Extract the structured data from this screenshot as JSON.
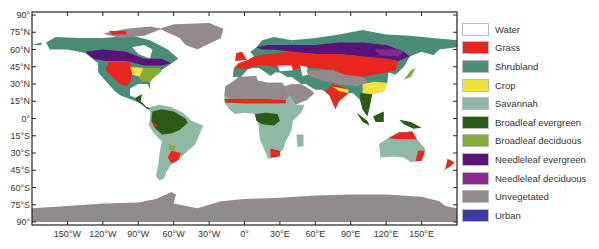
{
  "figure": {
    "type": "land cover map",
    "projection": "equirectangular",
    "frame": {
      "x0": 32,
      "y0": 12,
      "x1": 457,
      "y1": 225
    }
  },
  "axes": {
    "y_ticks": [
      {
        "lat": 90,
        "label": "90°"
      },
      {
        "lat": 75,
        "label": "75°N"
      },
      {
        "lat": 60,
        "label": "60°N"
      },
      {
        "lat": 45,
        "label": "45°N"
      },
      {
        "lat": 30,
        "label": "30°N"
      },
      {
        "lat": 15,
        "label": "15°N"
      },
      {
        "lat": 0,
        "label": "0°"
      },
      {
        "lat": -15,
        "label": "15°S"
      },
      {
        "lat": -30,
        "label": "30°S"
      },
      {
        "lat": -45,
        "label": "45°S"
      },
      {
        "lat": -60,
        "label": "60°S"
      },
      {
        "lat": -75,
        "label": "75°S"
      },
      {
        "lat": -90,
        "label": "90°"
      }
    ],
    "x_ticks": [
      {
        "lon": -150,
        "label": "150°W"
      },
      {
        "lon": -120,
        "label": "120°W"
      },
      {
        "lon": -90,
        "label": "90°W"
      },
      {
        "lon": -60,
        "label": "60°W"
      },
      {
        "lon": -30,
        "label": "30°W"
      },
      {
        "lon": 0,
        "label": "0°"
      },
      {
        "lon": 30,
        "label": "30°E"
      },
      {
        "lon": 60,
        "label": "60°E"
      },
      {
        "lon": 90,
        "label": "90°E"
      },
      {
        "lon": 120,
        "label": "120°E"
      },
      {
        "lon": 150,
        "label": "150°E"
      }
    ]
  },
  "legend": {
    "items": [
      {
        "key": "water",
        "label": "Water",
        "color": "#ffffff"
      },
      {
        "key": "grass",
        "label": "Grass",
        "color": "#e8281e"
      },
      {
        "key": "shrubland",
        "label": "Shrubland",
        "color": "#4a8c78"
      },
      {
        "key": "crop",
        "label": "Crop",
        "color": "#f2e23c"
      },
      {
        "key": "savannah",
        "label": "Savannah",
        "color": "#8fb8a6"
      },
      {
        "key": "broadleaf_evergreen",
        "label": "Broadleaf evergreen",
        "color": "#2e5a18"
      },
      {
        "key": "broadleaf_deciduous",
        "label": "Broadleaf deciduous",
        "color": "#86ac3a"
      },
      {
        "key": "needleleaf_evergreen",
        "label": "Needleleaf evergreen",
        "color": "#5a1478"
      },
      {
        "key": "needleleaf_deciduous",
        "label": "Needleleaf deciduous",
        "color": "#8a2a8e"
      },
      {
        "key": "unvegetated",
        "label": "Unvegetated",
        "color": "#938a8e"
      },
      {
        "key": "urban",
        "label": "Urban",
        "color": "#3c3ca4"
      }
    ]
  }
}
